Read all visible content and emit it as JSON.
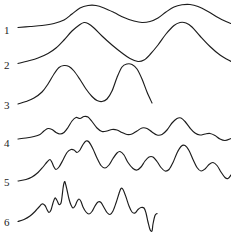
{
  "figure": {
    "title": "",
    "background_color": "#ffffff",
    "stroke_color": "#1c1c1c",
    "width": 231,
    "height": 241
  },
  "chart_data": {
    "type": "line",
    "title": "",
    "xlabel": "",
    "ylabel": "",
    "grid": false,
    "legend_position": "left-axis-labels",
    "axis_visible": false,
    "xlim": [
      0,
      231
    ],
    "ylim": [
      241,
      0
    ],
    "note": "Six stacked smoothed waveform traces of increasing oscillation frequency, each labelled 1-6 at its left starting end. y values are screen coordinates (origin top-left).",
    "series": [
      {
        "name": "1",
        "label": "1",
        "label_x": 4,
        "label_y": 34,
        "start_x": 18,
        "end_x": 231,
        "baseline_y": 27,
        "points": [
          [
            18,
            27.5
          ],
          [
            30,
            26.5
          ],
          [
            42,
            25.5
          ],
          [
            54,
            23.5
          ],
          [
            64,
            20.0
          ],
          [
            72,
            14.0
          ],
          [
            80,
            8.0
          ],
          [
            88,
            5.5
          ],
          [
            96,
            5.5
          ],
          [
            104,
            8.0
          ],
          [
            114,
            12.5
          ],
          [
            124,
            17.5
          ],
          [
            134,
            21.0
          ],
          [
            142,
            22.5
          ],
          [
            150,
            21.5
          ],
          [
            158,
            18.0
          ],
          [
            166,
            12.0
          ],
          [
            174,
            7.0
          ],
          [
            182,
            4.8
          ],
          [
            190,
            4.5
          ],
          [
            198,
            6.5
          ],
          [
            208,
            11.5
          ],
          [
            218,
            17.5
          ],
          [
            226,
            21.5
          ],
          [
            231,
            23.5
          ]
        ]
      },
      {
        "name": "2",
        "label": "2",
        "label_x": 4,
        "label_y": 69,
        "start_x": 18,
        "end_x": 231,
        "baseline_y": 63,
        "points": [
          [
            18,
            63.5
          ],
          [
            28,
            61.0
          ],
          [
            38,
            58.0
          ],
          [
            48,
            53.5
          ],
          [
            56,
            48.0
          ],
          [
            64,
            40.0
          ],
          [
            72,
            31.0
          ],
          [
            80,
            24.5
          ],
          [
            84,
            22.5
          ],
          [
            88,
            23.5
          ],
          [
            94,
            28.0
          ],
          [
            102,
            36.0
          ],
          [
            112,
            45.0
          ],
          [
            122,
            53.0
          ],
          [
            130,
            58.5
          ],
          [
            138,
            61.5
          ],
          [
            144,
            60.0
          ],
          [
            150,
            54.5
          ],
          [
            158,
            45.0
          ],
          [
            166,
            34.0
          ],
          [
            174,
            25.5
          ],
          [
            180,
            22.5
          ],
          [
            186,
            23.0
          ],
          [
            192,
            27.0
          ],
          [
            200,
            36.0
          ],
          [
            210,
            46.5
          ],
          [
            220,
            55.0
          ],
          [
            231,
            61.5
          ]
        ]
      },
      {
        "name": "3",
        "label": "3",
        "label_x": 4,
        "label_y": 109,
        "start_x": 18,
        "end_x": 152,
        "baseline_y": 103,
        "points": [
          [
            18,
            104.0
          ],
          [
            26,
            101.5
          ],
          [
            34,
            98.0
          ],
          [
            42,
            92.0
          ],
          [
            48,
            84.0
          ],
          [
            54,
            74.0
          ],
          [
            59,
            67.5
          ],
          [
            64,
            65.5
          ],
          [
            69,
            66.5
          ],
          [
            74,
            71.0
          ],
          [
            80,
            79.5
          ],
          [
            86,
            89.0
          ],
          [
            92,
            96.5
          ],
          [
            97,
            100.5
          ],
          [
            102,
            101.5
          ],
          [
            107,
            99.0
          ],
          [
            112,
            91.0
          ],
          [
            117,
            77.5
          ],
          [
            122,
            67.0
          ],
          [
            127,
            64.0
          ],
          [
            132,
            64.5
          ],
          [
            137,
            69.0
          ],
          [
            142,
            79.0
          ],
          [
            147,
            92.0
          ],
          [
            152,
            103.0
          ]
        ]
      },
      {
        "name": "4",
        "label": "4",
        "label_x": 4,
        "label_y": 147,
        "start_x": 18,
        "end_x": 231,
        "baseline_y": 138,
        "points": [
          [
            18,
            139.0
          ],
          [
            26,
            138.0
          ],
          [
            34,
            136.5
          ],
          [
            40,
            134.5
          ],
          [
            44,
            131.0
          ],
          [
            48,
            128.5
          ],
          [
            52,
            129.5
          ],
          [
            56,
            132.5
          ],
          [
            60,
            134.0
          ],
          [
            64,
            132.5
          ],
          [
            68,
            127.5
          ],
          [
            72,
            121.0
          ],
          [
            76,
            117.5
          ],
          [
            80,
            118.5
          ],
          [
            84,
            116.5
          ],
          [
            88,
            117.0
          ],
          [
            92,
            121.5
          ],
          [
            97,
            128.0
          ],
          [
            102,
            131.5
          ],
          [
            107,
            131.0
          ],
          [
            112,
            129.5
          ],
          [
            117,
            130.0
          ],
          [
            122,
            132.5
          ],
          [
            127,
            134.5
          ],
          [
            132,
            134.0
          ],
          [
            137,
            131.0
          ],
          [
            142,
            128.0
          ],
          [
            147,
            128.5
          ],
          [
            152,
            132.0
          ],
          [
            157,
            135.0
          ],
          [
            162,
            134.5
          ],
          [
            167,
            130.0
          ],
          [
            172,
            123.0
          ],
          [
            177,
            118.5
          ],
          [
            181,
            118.0
          ],
          [
            185,
            121.5
          ],
          [
            190,
            128.0
          ],
          [
            195,
            133.0
          ],
          [
            200,
            135.0
          ],
          [
            205,
            134.0
          ],
          [
            210,
            133.5
          ],
          [
            215,
            135.5
          ],
          [
            220,
            139.0
          ],
          [
            225,
            140.5
          ],
          [
            231,
            138.5
          ]
        ]
      },
      {
        "name": "5",
        "label": "5",
        "label_x": 4,
        "label_y": 186,
        "start_x": 18,
        "end_x": 231,
        "baseline_y": 180,
        "points": [
          [
            18,
            181.0
          ],
          [
            26,
            179.5
          ],
          [
            32,
            177.0
          ],
          [
            38,
            172.5
          ],
          [
            43,
            167.0
          ],
          [
            47,
            162.0
          ],
          [
            50,
            159.5
          ],
          [
            52,
            162.5
          ],
          [
            54,
            167.0
          ],
          [
            56,
            169.5
          ],
          [
            59,
            167.0
          ],
          [
            63,
            160.0
          ],
          [
            67,
            152.5
          ],
          [
            71,
            149.5
          ],
          [
            74,
            150.0
          ],
          [
            77,
            152.5
          ],
          [
            80,
            150.0
          ],
          [
            83,
            144.5
          ],
          [
            86,
            141.0
          ],
          [
            89,
            142.0
          ],
          [
            93,
            149.0
          ],
          [
            97,
            158.0
          ],
          [
            101,
            165.5
          ],
          [
            105,
            168.0
          ],
          [
            109,
            165.0
          ],
          [
            113,
            158.5
          ],
          [
            117,
            153.0
          ],
          [
            120,
            151.5
          ],
          [
            124,
            155.0
          ],
          [
            128,
            162.5
          ],
          [
            133,
            168.5
          ],
          [
            137,
            170.0
          ],
          [
            141,
            167.0
          ],
          [
            145,
            161.0
          ],
          [
            149,
            157.0
          ],
          [
            153,
            157.0
          ],
          [
            157,
            161.5
          ],
          [
            161,
            167.5
          ],
          [
            165,
            171.0
          ],
          [
            169,
            169.5
          ],
          [
            173,
            162.5
          ],
          [
            177,
            153.0
          ],
          [
            181,
            146.5
          ],
          [
            185,
            145.5
          ],
          [
            189,
            150.5
          ],
          [
            193,
            159.5
          ],
          [
            197,
            167.5
          ],
          [
            201,
            171.0
          ],
          [
            205,
            169.0
          ],
          [
            209,
            164.5
          ],
          [
            213,
            162.5
          ],
          [
            217,
            165.5
          ],
          [
            221,
            172.0
          ],
          [
            225,
            177.5
          ],
          [
            228,
            178.5
          ],
          [
            231,
            175.0
          ]
        ]
      },
      {
        "name": "6",
        "label": "6",
        "label_x": 4,
        "label_y": 226,
        "start_x": 18,
        "end_x": 157,
        "baseline_y": 221,
        "points": [
          [
            18,
            221.5
          ],
          [
            24,
            219.5
          ],
          [
            30,
            216.0
          ],
          [
            35,
            211.5
          ],
          [
            39,
            207.0
          ],
          [
            42,
            204.0
          ],
          [
            45,
            205.5
          ],
          [
            47,
            209.5
          ],
          [
            49,
            212.5
          ],
          [
            51,
            210.0
          ],
          [
            53,
            203.0
          ],
          [
            55,
            198.0
          ],
          [
            57,
            200.5
          ],
          [
            59,
            204.5
          ],
          [
            61,
            203.0
          ],
          [
            62,
            197.0
          ],
          [
            63,
            188.5
          ],
          [
            64,
            183.0
          ],
          [
            65,
            182.0
          ],
          [
            67,
            190.0
          ],
          [
            69,
            199.0
          ],
          [
            71,
            205.0
          ],
          [
            73,
            208.0
          ],
          [
            75,
            206.0
          ],
          [
            77,
            201.5
          ],
          [
            79,
            199.0
          ],
          [
            81,
            201.5
          ],
          [
            83,
            207.0
          ],
          [
            86,
            212.0
          ],
          [
            89,
            214.0
          ],
          [
            92,
            211.5
          ],
          [
            95,
            206.0
          ],
          [
            98,
            202.0
          ],
          [
            101,
            202.5
          ],
          [
            104,
            207.5
          ],
          [
            107,
            212.5
          ],
          [
            110,
            214.5
          ],
          [
            113,
            211.0
          ],
          [
            116,
            203.0
          ],
          [
            119,
            193.5
          ],
          [
            121,
            188.5
          ],
          [
            123,
            189.5
          ],
          [
            126,
            197.0
          ],
          [
            129,
            206.0
          ],
          [
            132,
            212.0
          ],
          [
            135,
            213.0
          ],
          [
            138,
            209.5
          ],
          [
            141,
            207.5
          ],
          [
            144,
            208.0
          ],
          [
            146,
            213.0
          ],
          [
            148,
            222.0
          ],
          [
            150,
            229.5
          ],
          [
            152,
            231.0
          ],
          [
            153,
            224.0
          ],
          [
            155,
            215.5
          ],
          [
            157,
            213.5
          ]
        ]
      }
    ]
  }
}
